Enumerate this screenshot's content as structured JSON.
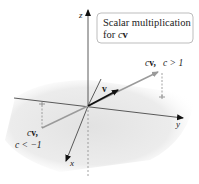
{
  "title_box": {
    "line1": "Scalar multiplication",
    "line2_prefix": "for ",
    "line2_c": "c",
    "line2_v": "v"
  },
  "axes": {
    "x_label": "x",
    "y_label": "y",
    "z_label": "z"
  },
  "vectors": {
    "v_label": "v",
    "pos_label_cv": "cv,",
    "pos_condition": "c > 1",
    "neg_label_cv": "cv,",
    "neg_condition": "c < −1"
  },
  "colors": {
    "axis": "#333333",
    "vector_v": "#111111",
    "vector_cv": "#9a9a9a",
    "plane_shade": "#e6e6e6",
    "box_border": "#b5b5b5",
    "dashed": "#8a8a8a"
  }
}
